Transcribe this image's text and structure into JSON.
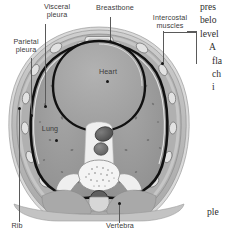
{
  "figure": {
    "kind": "thorax-cross-section",
    "labels": {
      "visceral_pleura": "Visceral\npleura",
      "visceral_pleura_l1": "Visceral",
      "visceral_pleura_l2": "pleura",
      "parietal_pleura_l1": "Parietal",
      "parietal_pleura_l2": "pleura",
      "breastbone": "Breastbone",
      "intercostal_l1": "Intercostal",
      "intercostal_l2": "muscles",
      "heart": "Heart",
      "lung": "Lung",
      "rib": "Rib",
      "vertebra": "Vertebra"
    },
    "colors": {
      "lung_fill": "#9a9a9a",
      "heart_fill": "#a8a8a8",
      "pleura_line": "#111111",
      "chest_wall": "#bcbcbc",
      "background": "#ffffff",
      "label_text": "#3b3b3b",
      "leader_line": "#5a5a5a",
      "marker_dot": "#161616"
    }
  },
  "bodytext": {
    "lines": [
      "pres",
      "belo",
      "level",
      "A",
      "fla",
      "ch",
      "i"
    ],
    "tail": "ple"
  }
}
